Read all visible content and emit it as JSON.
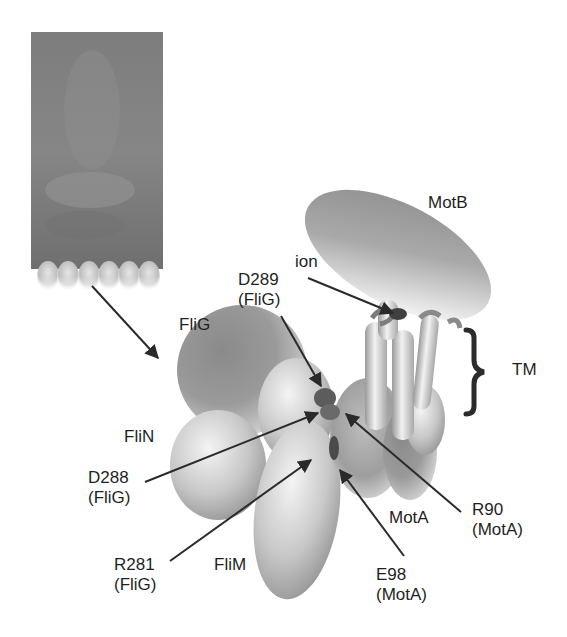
{
  "figure": {
    "inset": {
      "kind": "electron-micrograph",
      "bead_count": 6
    },
    "labels": {
      "motB": "MotB",
      "ion": "ion",
      "tm": "TM",
      "fliG": "FliG",
      "fliN": "FliN",
      "fliM": "FliM",
      "motA": "MotA",
      "d289": {
        "residue": "D289",
        "protein": "(FliG)"
      },
      "d288": {
        "residue": "D288",
        "protein": "(FliG)"
      },
      "r281": {
        "residue": "R281",
        "protein": "(FliG)"
      },
      "r90": {
        "residue": "R90",
        "protein": "(MotA)"
      },
      "e98": {
        "residue": "E98",
        "protein": "(MotA)"
      }
    },
    "colors": {
      "background": "#ffffff",
      "text": "#1f1f1f",
      "arrow": "#2a2a2a",
      "micrograph": "#7a7a7a",
      "bracket": "#2b2b2b"
    }
  }
}
